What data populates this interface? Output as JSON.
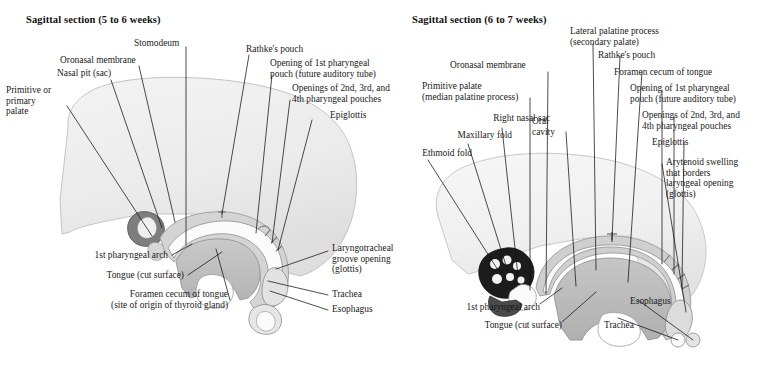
{
  "figure": {
    "background_color": "#ffffff",
    "ink_color": "#1a1a1a",
    "leader_color": "#111111"
  },
  "panels": [
    {
      "id": "left",
      "title": "Sagittal section (5 to 6 weeks)",
      "labels": [
        {
          "id": "primitive-or-primary-palate",
          "text": "Primitive or\nprimary\npalate"
        },
        {
          "id": "nasal-pit-sac",
          "text": "Nasal pit (sac)"
        },
        {
          "id": "oronasal-membrane",
          "text": "Oronasal membrane"
        },
        {
          "id": "stomodeum",
          "text": "Stomodeum"
        },
        {
          "id": "rathkes-pouch",
          "text": "Rathke's pouch"
        },
        {
          "id": "opening-1st-pharyngeal-pouch",
          "text": "Opening of 1st pharyngeal\npouch (future auditory tube)"
        },
        {
          "id": "openings-2nd-3rd-4th-pharyngeal-pouches",
          "text": "Openings of 2nd, 3rd, and\n4th pharyngeal pouches"
        },
        {
          "id": "epiglottis",
          "text": "Epiglottis"
        },
        {
          "id": "laryngotracheal-groove-opening",
          "text": "Laryngotracheal\ngroove opening\n(glottis)"
        },
        {
          "id": "trachea",
          "text": "Trachea"
        },
        {
          "id": "esophagus",
          "text": "Esophagus"
        },
        {
          "id": "1st-pharyngeal-arch",
          "text": "1st pharyngeal arch"
        },
        {
          "id": "tongue-cut-surface",
          "text": "Tongue (cut surface)"
        },
        {
          "id": "foramen-cecum-of-tongue",
          "text": "Foramen cecum of tongue\n(site of origin of thyroid gland)"
        }
      ]
    },
    {
      "id": "right",
      "title": "Sagittal section (6 to 7 weeks)",
      "labels": [
        {
          "id": "ethmoid-fold",
          "text": "Ethmoid fold"
        },
        {
          "id": "maxillary-fold",
          "text": "Maxillary fold"
        },
        {
          "id": "right-nasal-sac",
          "text": "Right nasal sac"
        },
        {
          "id": "primitive-palate",
          "text": "Primitive palate\n(median palatine process)"
        },
        {
          "id": "oronasal-membrane",
          "text": "Oronasal membrane"
        },
        {
          "id": "oral-cavity",
          "text": "Oral\ncavity"
        },
        {
          "id": "lateral-palatine-process",
          "text": "Lateral palatine process\n(secondary palate)"
        },
        {
          "id": "rathkes-pouch",
          "text": "Rathke's pouch"
        },
        {
          "id": "foramen-cecum-of-tongue",
          "text": "Foramen cecum of tongue"
        },
        {
          "id": "opening-1st-pharyngeal-pouch",
          "text": "Opening of 1st pharyngeal\npouch (future auditory tube)"
        },
        {
          "id": "openings-2nd-3rd-4th-pharyngeal-pouches",
          "text": "Openings of 2nd, 3rd, and\n4th pharyngeal pouches"
        },
        {
          "id": "epiglottis",
          "text": "Epiglottis"
        },
        {
          "id": "arytenoid-swelling",
          "text": "Arytenoid swelling\nthat borders\nlaryngeal opening\n(glottis)"
        },
        {
          "id": "1st-pharyngeal-arch",
          "text": "1st pharyngeal arch"
        },
        {
          "id": "tongue-cut-surface",
          "text": "Tongue (cut surface)"
        },
        {
          "id": "trachea",
          "text": "Trachea"
        },
        {
          "id": "esophagus",
          "text": "Esophagus"
        }
      ]
    }
  ]
}
